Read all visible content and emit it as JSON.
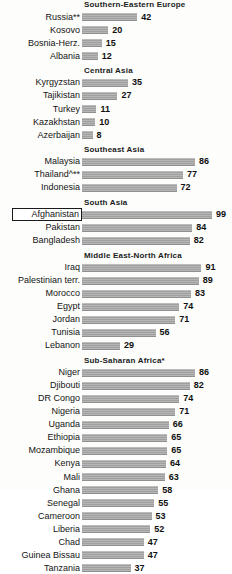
{
  "chart_data": {
    "type": "bar",
    "orientation": "horizontal",
    "title": "",
    "xlabel": "",
    "ylabel": "",
    "xlim": [
      0,
      99
    ],
    "grid": false,
    "legend": null,
    "value_suffix": "",
    "highlighted_category": "Afghanistan",
    "sections": [
      {
        "header": "Southern-Eastern Europe",
        "categories": [
          "Russia**",
          "Kosovo",
          "Bosnia-Herz.",
          "Albania"
        ],
        "values": [
          42,
          20,
          15,
          12
        ]
      },
      {
        "header": "Central Asia",
        "categories": [
          "Kyrgyzstan",
          "Tajikistan",
          "Turkey",
          "Kazakhstan",
          "Azerbaijan"
        ],
        "values": [
          35,
          27,
          11,
          10,
          8
        ]
      },
      {
        "header": "Southeast Asia",
        "categories": [
          "Malaysia",
          "Thailand^**",
          "Indonesia"
        ],
        "values": [
          86,
          77,
          72
        ]
      },
      {
        "header": "South Asia",
        "categories": [
          "Afghanistan",
          "Pakistan",
          "Bangladesh"
        ],
        "values": [
          99,
          84,
          82
        ]
      },
      {
        "header": "Middle East-North Africa",
        "categories": [
          "Iraq",
          "Palestinian terr.",
          "Morocco",
          "Egypt",
          "Jordan",
          "Tunisia",
          "Lebanon"
        ],
        "values": [
          91,
          89,
          83,
          74,
          71,
          56,
          29
        ]
      },
      {
        "header": "Sub-Saharan Africa*",
        "categories": [
          "Niger",
          "Djibouti",
          "DR Congo",
          "Nigeria",
          "Uganda",
          "Ethiopia",
          "Mozambique",
          "Kenya",
          "Mali",
          "Ghana",
          "Senegal",
          "Cameroon",
          "Liberia",
          "Chad",
          "Guinea Bissau",
          "Tanzania"
        ],
        "values": [
          86,
          82,
          74,
          71,
          66,
          65,
          65,
          64,
          63,
          58,
          55,
          53,
          52,
          47,
          47,
          37
        ]
      }
    ],
    "colors": {
      "bar": "#a8a8a8",
      "text": "#141414",
      "highlight_border": "#1a1a1a",
      "background": "#fdfdfc"
    }
  }
}
